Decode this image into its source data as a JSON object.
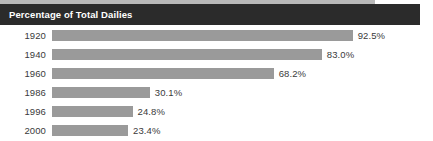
{
  "header": {
    "title": "Percentage of Total Dailies",
    "background_color": "#2b2b2b",
    "text_color": "#ffffff"
  },
  "top_strip": {
    "color": "#b9b9b9"
  },
  "chart_data": {
    "type": "bar",
    "orientation": "horizontal",
    "title": "Percentage of Total Dailies",
    "xlabel": "",
    "ylabel": "",
    "categories": [
      "1920",
      "1940",
      "1960",
      "1986",
      "1996",
      "2000"
    ],
    "values": [
      92.5,
      83.0,
      68.2,
      30.1,
      24.8,
      23.4
    ],
    "value_labels": [
      "92.5%",
      "83.0%",
      "68.2%",
      "30.1%",
      "24.8%",
      "23.4%"
    ],
    "xlim": [
      0,
      100
    ],
    "grid": false,
    "legend": false,
    "bar_color": "#9a9a9a",
    "label_color": "#3a3a3a",
    "units": "percent"
  }
}
